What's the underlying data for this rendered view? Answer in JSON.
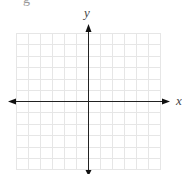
{
  "diagram": {
    "type": "coordinate-plane",
    "axes": {
      "x_label": "x",
      "y_label": "y"
    },
    "grid": {
      "columns": 12,
      "rows": 12,
      "line_color": "#e4e4e4",
      "axis_color": "#222222"
    },
    "partial_text": "g"
  }
}
